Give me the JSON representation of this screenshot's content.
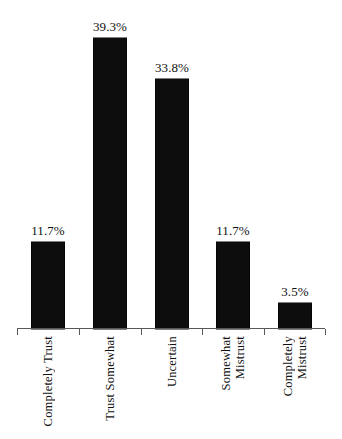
{
  "chart_data": {
    "type": "bar",
    "title": "",
    "subtitle": "",
    "xlabel": "",
    "ylabel": "",
    "categories": [
      "Completely Trust",
      "Trust Somewhat",
      "Uncertain",
      "Somewhat Mistrust",
      "Completely Mistrust"
    ],
    "category_lines": [
      [
        "Completely Trust"
      ],
      [
        "Trust Somewhat"
      ],
      [
        "Uncertain"
      ],
      [
        "Somewhat",
        "Mistrust"
      ],
      [
        "Completely",
        "Mistrust"
      ]
    ],
    "values": [
      11.7,
      39.3,
      33.8,
      11.7,
      3.5
    ],
    "value_labels": [
      "11.7%",
      "39.3%",
      "33.8%",
      "11.7%",
      "3.5%"
    ],
    "units": "percent",
    "ylim": [
      0,
      44.5
    ],
    "grid": false,
    "legend": null,
    "series": [
      {
        "name": "Trust level share",
        "values": [
          11.7,
          39.3,
          33.8,
          11.7,
          3.5
        ]
      }
    ],
    "colors": {
      "bar": "#0d0d0d",
      "axis": "#585858",
      "text": "#111111",
      "background": "#ffffff"
    }
  },
  "axis": {
    "tick_count": 6,
    "baseline_label": ""
  }
}
